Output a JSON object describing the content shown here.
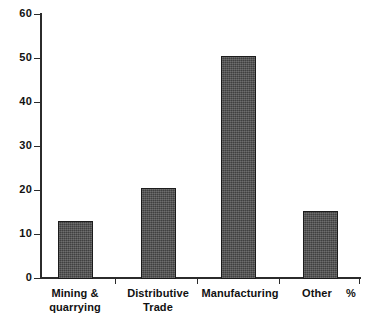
{
  "chart_data": {
    "type": "bar",
    "title": "",
    "subtitle": "",
    "xlabel": "",
    "ylabel": "",
    "unit_annotation": "%",
    "categories": [
      "Mining & quarrying",
      "Distributive Trade",
      "Manufacturing",
      "Other"
    ],
    "category_lines": [
      [
        "Mining &",
        "quarrying"
      ],
      [
        "Distributive",
        "Trade"
      ],
      [
        "Manufacturing",
        ""
      ],
      [
        "Other",
        ""
      ]
    ],
    "values": [
      13.0,
      20.5,
      50.2,
      15.4
    ],
    "ylim": [
      0,
      60
    ],
    "ytick_values": [
      0,
      10,
      20,
      30,
      40,
      50,
      60
    ],
    "ytick_labels": [
      "0",
      "10",
      "20",
      "30",
      "40",
      "50",
      "60"
    ],
    "grid": false,
    "legend": false,
    "legend_position": "none",
    "bar_fill_color": "#4e4e4e",
    "bar_border_color": "#1c1c1c",
    "axis_color": "#2b2b2b",
    "background_color": "#ffffff"
  }
}
